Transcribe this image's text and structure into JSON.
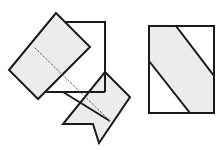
{
  "figure": {
    "title": "Folded diagonal strip on a square sheet",
    "background_color": "#ffffff",
    "stroke_color": "#1a1a1a",
    "shaded_fill": "#ececec",
    "white_fill": "#ffffff",
    "fold_line_color": "#5a5a5a",
    "canvas": {
      "width": 223,
      "height": 150
    },
    "panels": [
      {
        "id": "left",
        "name": "folding-step-panel",
        "caption": "",
        "elements": [
          {
            "name": "sheet-square",
            "kind": "square-sheet",
            "fill": "#ffffff",
            "points": "55,22 105,22 105,92 36,92"
          },
          {
            "name": "upper-flap",
            "kind": "folded-strip-flap",
            "fill": "#ececec",
            "points": "56,13 90,47 38,99 9,70"
          },
          {
            "name": "lower-flap",
            "kind": "folded-strip-flap",
            "fill": "#ececec",
            "points": "105,72 130,97 99,143 93,124 63,124"
          },
          {
            "name": "fold-line",
            "kind": "dashed-fold-line",
            "stroke": "#5a5a5a",
            "points": "35,48 110,121"
          }
        ]
      },
      {
        "id": "right",
        "name": "result-panel",
        "caption": "",
        "elements": [
          {
            "name": "result-square",
            "kind": "square-sheet",
            "fill": "#ffffff",
            "points": "149,26 214,26 214,113 149,113"
          },
          {
            "name": "diagonal-band",
            "kind": "shaded-band",
            "fill": "#ececec",
            "points": "149,61 149,26 176,26 214,76 214,113 190,113"
          }
        ]
      }
    ]
  }
}
